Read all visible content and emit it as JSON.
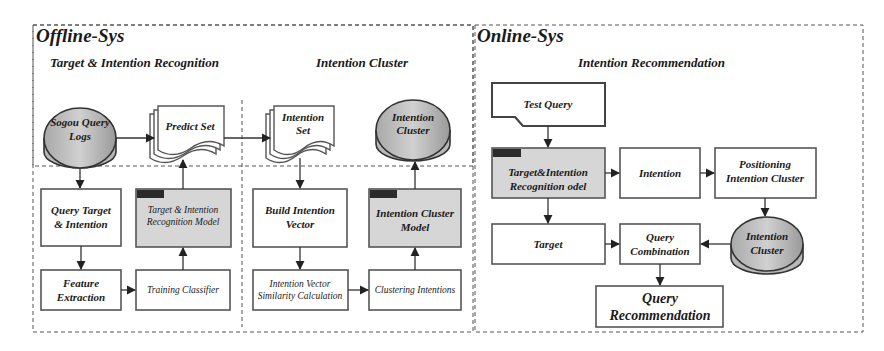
{
  "panels": {
    "offline": {
      "title": "Offline-Sys",
      "sections": {
        "recognition": "Target & Intention Recognition",
        "cluster": "Intention Cluster"
      },
      "nodes": {
        "sogou_logs": [
          "Sogou Query",
          "Logs"
        ],
        "predict_set": [
          "Predict Set"
        ],
        "query_target": [
          "Query Target",
          "& Intention"
        ],
        "recog_model": [
          "Target & Intention",
          "Recognition Model"
        ],
        "feature_extraction": [
          "Feature",
          "Extraction"
        ],
        "training_classifier": [
          "Training Classifier"
        ],
        "intention_set": [
          "Intention",
          "Set"
        ],
        "intention_cluster_db": [
          "Intention",
          "Cluster"
        ],
        "build_vector": [
          "Build Intention",
          "Vector"
        ],
        "cluster_model": [
          "Intention Cluster",
          "Model"
        ],
        "similarity_calc": [
          "Intention Vector",
          "Similarity Calculation"
        ],
        "clustering": [
          "Clustering Intentions"
        ]
      }
    },
    "online": {
      "title": "Online-Sys",
      "sections": {
        "recommendation": "Intention Recommendation"
      },
      "nodes": {
        "test_query": [
          "Test Query"
        ],
        "recog_model": [
          "Target&Intention",
          "Recognition odel"
        ],
        "intention": [
          "Intention"
        ],
        "positioning": [
          "Positioning",
          "Intention Cluster"
        ],
        "target": [
          "Target"
        ],
        "query_combination": [
          "Query",
          "Combination"
        ],
        "intention_cluster_db": [
          "Intention",
          "Cluster"
        ],
        "query_recommendation": [
          "Query",
          "Recommendation"
        ]
      }
    }
  },
  "colors": {
    "stroke": "#555555",
    "model_fill": "#d6d6d6",
    "db_fill": "#c4c4c4",
    "tab_fill": "#2b2b2b"
  }
}
